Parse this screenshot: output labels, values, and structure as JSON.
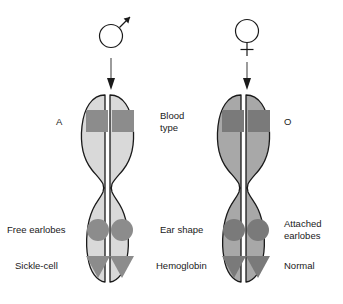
{
  "figure": {
    "background_color": "#ffffff",
    "outline_color": "#1a1a1a",
    "text_color": "#1a1a1a"
  },
  "parents": [
    {
      "id": "father",
      "symbol_name": "male-symbol",
      "symbol_glyph": "♂",
      "arrow_name": "inheritance-arrow-from-father"
    },
    {
      "id": "mother",
      "symbol_name": "female-symbol",
      "symbol_glyph": "♀",
      "arrow_name": "inheritance-arrow-from-mother"
    }
  ],
  "chromosomes": [
    {
      "id": "paternal-chromosome",
      "body_color": "#d9d9d9",
      "marker_color": "#8c8c8c",
      "outline_color": "#1a1a1a",
      "genes": [
        {
          "trait_key": "blood_type",
          "marker_shape": "square",
          "allele_label": "A"
        },
        {
          "trait_key": "ear_shape",
          "marker_shape": "circle",
          "allele_label": "Free earlobes"
        },
        {
          "trait_key": "hemoglobin",
          "marker_shape": "triangle",
          "allele_label": "Sickle-cell"
        }
      ]
    },
    {
      "id": "maternal-chromosome",
      "body_color": "#a8a8a8",
      "marker_color": "#7a7a7a",
      "outline_color": "#1a1a1a",
      "genes": [
        {
          "trait_key": "blood_type",
          "marker_shape": "square",
          "allele_label": "O"
        },
        {
          "trait_key": "ear_shape",
          "marker_shape": "circle",
          "allele_label": "Attached\nearlobes"
        },
        {
          "trait_key": "hemoglobin",
          "marker_shape": "triangle",
          "allele_label": "Normal"
        }
      ]
    }
  ],
  "trait_labels": {
    "blood_type": "Blood\ntype",
    "ear_shape": "Ear shape",
    "hemoglobin": "Hemoglobin"
  },
  "left_labels": {
    "blood_type_allele": "A",
    "ear_shape_allele": "Free earlobes",
    "hemoglobin_allele": "Sickle-cell"
  },
  "right_labels": {
    "blood_type_allele": "O",
    "ear_shape_allele": "Attached\nearlobes",
    "hemoglobin_allele": "Normal"
  }
}
